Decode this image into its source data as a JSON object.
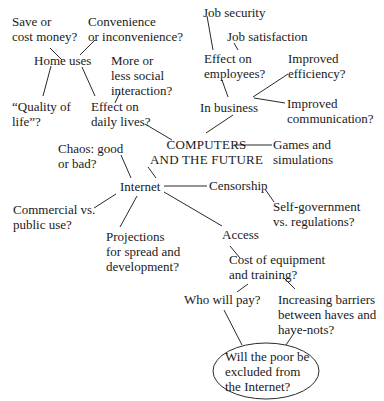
{
  "diagram": {
    "type": "cluster-map",
    "center": {
      "lines": [
        "COMPUTERS",
        "AND THE FUTURE"
      ]
    },
    "nodes": {
      "save_money": {
        "lines": [
          "Save or",
          "cost money?"
        ]
      },
      "convenience": {
        "lines": [
          "Convenience",
          "or inconvenience?"
        ]
      },
      "home_uses": {
        "lines": [
          "Home uses"
        ]
      },
      "social_interaction": {
        "lines": [
          "More or",
          "less social",
          "interaction?"
        ]
      },
      "quality_of_life": {
        "lines": [
          "“Quality of",
          "life”?"
        ]
      },
      "daily_lives": {
        "lines": [
          "Effect on",
          "daily lives?"
        ]
      },
      "job_security": {
        "lines": [
          "Job security"
        ]
      },
      "job_satisfaction": {
        "lines": [
          "Job satisfaction"
        ]
      },
      "effect_employees": {
        "lines": [
          "Effect on",
          "employees?"
        ]
      },
      "improved_efficiency": {
        "lines": [
          "Improved",
          "efficiency?"
        ]
      },
      "in_business": {
        "lines": [
          "In business"
        ]
      },
      "improved_communication": {
        "lines": [
          "Improved",
          "communication?"
        ]
      },
      "chaos": {
        "lines": [
          "Chaos: good",
          "or bad?"
        ]
      },
      "games": {
        "lines": [
          "Games and",
          "simulations"
        ]
      },
      "internet": {
        "lines": [
          "Internet"
        ]
      },
      "censorship": {
        "lines": [
          "Censorship"
        ]
      },
      "commercial": {
        "lines": [
          "Commercial vs.",
          "public use?"
        ]
      },
      "self_government": {
        "lines": [
          "Self-government",
          "vs. regulations?"
        ]
      },
      "projections": {
        "lines": [
          "Projections",
          "for spread and",
          "development?"
        ]
      },
      "access": {
        "lines": [
          "Access"
        ]
      },
      "cost_equipment": {
        "lines": [
          "Cost of equipment",
          "and training?"
        ]
      },
      "who_will_pay": {
        "lines": [
          "Who will pay?"
        ]
      },
      "barriers": {
        "lines": [
          "Increasing barriers",
          "between haves and",
          "have-nots?"
        ]
      },
      "poor_excluded": {
        "lines": [
          "Will the poor be",
          "excluded from",
          "the Internet?"
        ]
      }
    },
    "edges": [
      [
        "home_uses",
        "save_money"
      ],
      [
        "home_uses",
        "convenience"
      ],
      [
        "home_uses",
        "quality_of_life"
      ],
      [
        "home_uses",
        "daily_lives"
      ],
      [
        "daily_lives",
        "social_interaction"
      ],
      [
        "daily_lives",
        "center"
      ],
      [
        "effect_employees",
        "job_security"
      ],
      [
        "effect_employees",
        "job_satisfaction"
      ],
      [
        "in_business",
        "effect_employees"
      ],
      [
        "in_business",
        "improved_efficiency"
      ],
      [
        "in_business",
        "improved_communication"
      ],
      [
        "in_business",
        "center"
      ],
      [
        "center",
        "games"
      ],
      [
        "center",
        "internet"
      ],
      [
        "internet",
        "chaos"
      ],
      [
        "internet",
        "commercial"
      ],
      [
        "internet",
        "projections"
      ],
      [
        "internet",
        "censorship"
      ],
      [
        "internet",
        "access"
      ],
      [
        "censorship",
        "self_government"
      ],
      [
        "access",
        "cost_equipment"
      ],
      [
        "cost_equipment",
        "who_will_pay"
      ],
      [
        "cost_equipment",
        "barriers"
      ],
      [
        "who_will_pay",
        "poor_excluded"
      ],
      [
        "barriers",
        "poor_excluded"
      ]
    ]
  }
}
